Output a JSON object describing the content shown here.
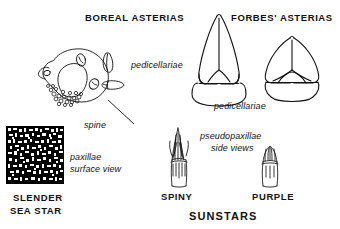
{
  "figure": {
    "title_boreal": "BOREAL ASTERIAS",
    "title_forbes": "FORBES' ASTERIAS",
    "label_pedicellariae_top": "pedicellariae",
    "label_pedicellariae_mid": "pedicellariae",
    "label_spine": "spine",
    "label_paxillae_line1": "paxillae",
    "label_paxillae_line2": "surface view",
    "label_pseudopaxillae_line1": "pseudopaxillae",
    "label_pseudopaxillae_line2": "side views",
    "name_slender_line1": "SLENDER",
    "name_slender_line2": "SEA STAR",
    "name_spiny": "SPINY",
    "name_purple": "PURPLE",
    "name_sunstars": "SUNSTARS"
  },
  "colors": {
    "ink": "#111111",
    "paper": "#ffffff",
    "fill_black": "#000000"
  },
  "icons": {
    "sea_star_body": "sea-star-arm-base-drawing",
    "pedicellaria_small_a": "pedicellaria-small-pointed",
    "pedicellaria_small_b": "pedicellaria-small-blunt",
    "pedicellaria_boreal": "pedicellaria-boreal-elongate",
    "pedicellaria_forbes": "pedicellaria-forbes-broad",
    "paxillae_texture": "paxillae-surface-texture",
    "pseudopaxilla_spiny": "pseudopaxilla-spiny-side-view",
    "pseudopaxilla_purple": "pseudopaxilla-purple-side-view",
    "spine_leader": "spine-leader-line"
  }
}
